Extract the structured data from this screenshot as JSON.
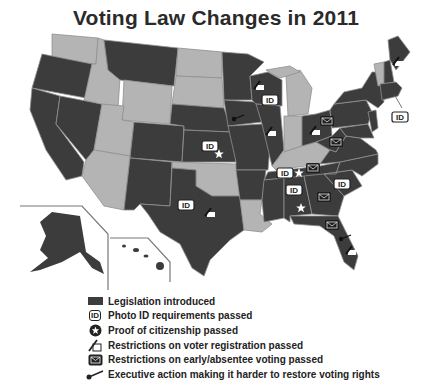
{
  "title": "Voting Law Changes in 2011",
  "colors": {
    "legislation_introduced": "#3c3c3c",
    "no_legislation": "#b4b4b4",
    "border": "#8a8a8a",
    "background": "#ffffff"
  },
  "map": {
    "states_legislation_introduced": [
      "WA-no",
      "OR",
      "CA",
      "NV",
      "MT",
      "CO",
      "NM",
      "NE",
      "KS",
      "TX",
      "MN",
      "IA",
      "MO",
      "AR",
      "WI",
      "IL",
      "OH",
      "PA",
      "NY",
      "ME",
      "NH",
      "MA",
      "CT",
      "RI",
      "NJ",
      "DE",
      "MD",
      "VA",
      "WV",
      "NC",
      "SC",
      "GA",
      "FL",
      "AL",
      "MS",
      "TN",
      "AK",
      "HI"
    ],
    "states_no_legislation": [
      "WA",
      "ID",
      "WY",
      "UT",
      "AZ",
      "ND",
      "SD",
      "OK",
      "LA",
      "MI",
      "IN",
      "KY",
      "VT"
    ],
    "markers": [
      {
        "state": "KS",
        "icons": [
          "ID",
          "star"
        ]
      },
      {
        "state": "TX",
        "icons": [
          "ID",
          "registration"
        ]
      },
      {
        "state": "WI",
        "icons": [
          "registration",
          "ID"
        ]
      },
      {
        "state": "IA",
        "icons": [
          "executive"
        ]
      },
      {
        "state": "IL",
        "icons": [
          "registration"
        ]
      },
      {
        "state": "OH",
        "icons": [
          "registration",
          "envelope"
        ]
      },
      {
        "state": "WV",
        "icons": [
          "envelope"
        ]
      },
      {
        "state": "TN",
        "icons": [
          "ID",
          "star",
          "envelope"
        ]
      },
      {
        "state": "SC",
        "icons": [
          "ID"
        ]
      },
      {
        "state": "AL",
        "icons": [
          "ID",
          "star"
        ]
      },
      {
        "state": "GA",
        "icons": [
          "envelope"
        ]
      },
      {
        "state": "FL",
        "icons": [
          "envelope",
          "executive",
          "registration"
        ]
      },
      {
        "state": "ME",
        "icons": [
          "registration"
        ]
      },
      {
        "state": "RI",
        "icons": [
          "ID"
        ]
      }
    ],
    "id_label": "ID"
  },
  "legend": {
    "items": [
      {
        "icon": "legislation-swatch",
        "label": "Legislation introduced"
      },
      {
        "icon": "photo-id-icon",
        "label": "Photo ID requirements passed",
        "badge": "ID"
      },
      {
        "icon": "star-icon",
        "label": "Proof of citizenship passed"
      },
      {
        "icon": "registration-icon",
        "label": "Restrictions on voter registration passed"
      },
      {
        "icon": "envelope-icon",
        "label": "Restrictions on early/absentee voting passed"
      },
      {
        "icon": "gavel-icon",
        "label": "Executive action making it harder to restore voting rights"
      }
    ]
  }
}
